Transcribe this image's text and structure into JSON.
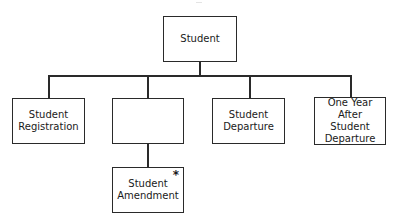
{
  "diagram": {
    "type": "hierarchy",
    "root": {
      "label": "Student"
    },
    "children": [
      {
        "label": "Student\nRegistration"
      },
      {
        "label": "",
        "children": [
          {
            "label": "Student\nAmendment",
            "marker": "*"
          }
        ]
      },
      {
        "label": "Student\nDeparture"
      },
      {
        "label": "One Year After\nStudent\nDeparture"
      }
    ]
  },
  "colors": {
    "line": "#2a2a2a",
    "background": "#ffffff"
  }
}
